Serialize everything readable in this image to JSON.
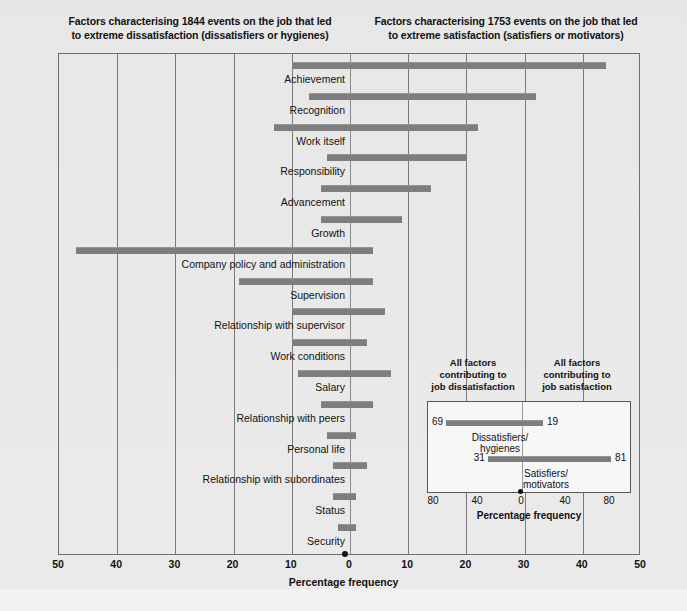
{
  "headers": {
    "left": "Factors characterising 1844 events on the job that led to extreme dissatisfaction (dissatisfiers or hygienes)",
    "left_line1": "Factors characterising 1844 events on the job that led",
    "left_line2": "to extreme dissatisfaction (dissatisfiers or hygienes)",
    "right_line1": "Factors characterising 1753 events on the job that led",
    "right_line2": "to extreme satisfaction (satisfiers or motivators)"
  },
  "axis": {
    "title": "Percentage frequency",
    "ticks": [
      50,
      40,
      30,
      20,
      10,
      0,
      10,
      20,
      30,
      40,
      50
    ],
    "min": -50,
    "max": 50
  },
  "colors": {
    "bar": "#7e7e7e",
    "background": "#e9e9e9",
    "frame": "#6f6f6f",
    "text": "#111111"
  },
  "chart_data": {
    "type": "bar",
    "xlabel": "Percentage frequency",
    "ylabel": "",
    "xlim": [
      -50,
      50
    ],
    "grid": true,
    "legend": "none",
    "note": "Negative values = percentage frequency on the dissatisfaction (left) side; positive values = satisfaction (right) side.",
    "categories": [
      "Achievement",
      "Recognition",
      "Work itself",
      "Responsibility",
      "Advancement",
      "Growth",
      "Company policy and administration",
      "Supervision",
      "Relationship with supervisor",
      "Work conditions",
      "Salary",
      "Relationship with peers",
      "Personal life",
      "Relationship with subordinates",
      "Status",
      "Security"
    ],
    "series": [
      {
        "name": "Dissatisfaction side (left extent, %)",
        "values": [
          10,
          7,
          13,
          4,
          5,
          5,
          47,
          19,
          10,
          10,
          9,
          5,
          4,
          3,
          3,
          2
        ]
      },
      {
        "name": "Satisfaction side (right extent, %)",
        "values": [
          44,
          32,
          22,
          20,
          14,
          9,
          4,
          4,
          6,
          3,
          7,
          4,
          1,
          3,
          1,
          1
        ]
      }
    ]
  },
  "bars": [
    {
      "label": "Achievement",
      "left": 10,
      "right": 44
    },
    {
      "label": "Recognition",
      "left": 7,
      "right": 32
    },
    {
      "label": "Work itself",
      "left": 13,
      "right": 22
    },
    {
      "label": "Responsibility",
      "left": 4,
      "right": 20
    },
    {
      "label": "Advancement",
      "left": 5,
      "right": 14
    },
    {
      "label": "Growth",
      "left": 5,
      "right": 9
    },
    {
      "label": "Company policy and administration",
      "left": 47,
      "right": 4
    },
    {
      "label": "Supervision",
      "left": 19,
      "right": 4
    },
    {
      "label": "Relationship with supervisor",
      "left": 10,
      "right": 6
    },
    {
      "label": "Work conditions",
      "left": 10,
      "right": 3
    },
    {
      "label": "Salary",
      "left": 9,
      "right": 7
    },
    {
      "label": "Relationship with peers",
      "left": 5,
      "right": 4
    },
    {
      "label": "Personal life",
      "left": 4,
      "right": 1
    },
    {
      "label": "Relationship with subordinates",
      "left": 3,
      "right": 3
    },
    {
      "label": "Status",
      "left": 3,
      "right": 1
    },
    {
      "label": "Security",
      "left": 2,
      "right": 1
    }
  ],
  "inset": {
    "head_left_line1": "All factors",
    "head_left_line2": "contributing to",
    "head_left_line3": "job dissatisfaction",
    "head_right_line1": "All factors",
    "head_right_line2": "contributing to",
    "head_right_line3": "job satisfaction",
    "axis_title": "Percentage frequency",
    "ticks": [
      80,
      40,
      0,
      40,
      80
    ],
    "rows": [
      {
        "caption_line1": "Dissatisfiers/",
        "caption_line2": "hygienes",
        "left_value": 69,
        "right_value": 19
      },
      {
        "caption_line1": "Satisfiers/",
        "caption_line2": "motivators",
        "left_value": 31,
        "right_value": 81
      }
    ]
  }
}
